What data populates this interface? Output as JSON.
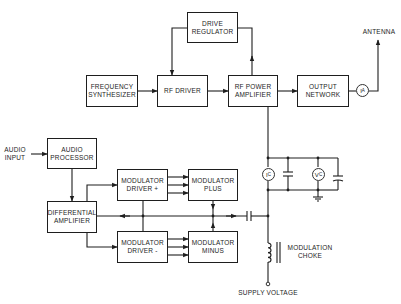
{
  "diagram": {
    "blocks": {
      "drive_regulator": "DRIVE\nREGULATOR",
      "frequency_synthesizer": "FREQUENCY\nSYNTHESIZER",
      "rf_driver": "RF DRIVER",
      "rf_power_amplifier": "RF POWER\nAMPLIFIER",
      "output_network": "OUTPUT\nNETWORK",
      "audio_processor": "AUDIO\nPROCESSOR",
      "differential_amplifier": "DIFFERENTIAL\nAMPLIFIER",
      "modulator_driver_plus": "MODULATOR\nDRIVER +",
      "modulator_plus": "MODULATOR\nPLUS",
      "modulator_driver_minus": "MODULATOR\nDRIVER -",
      "modulator_minus": "MODULATOR\nMINUS"
    },
    "labels": {
      "antenna": "ANTENNA",
      "audio_input": "AUDIO\nINPUT",
      "modulation_choke": "MODULATION\nCHOKE",
      "supply_voltage": "SUPPLY VOLTAGE"
    },
    "meters": {
      "antenna_current": "I",
      "antenna_current_sub": "A",
      "collector_current": "I",
      "collector_current_sub": "C",
      "collector_voltage": "V",
      "collector_voltage_sub": "C"
    },
    "colors": {
      "line": "#1e1e1e",
      "background": "#ffffff"
    }
  }
}
